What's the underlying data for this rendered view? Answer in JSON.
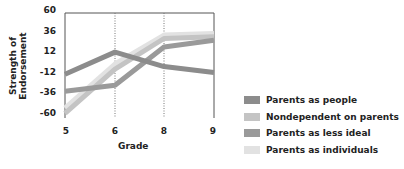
{
  "chart_data": {
    "type": "line",
    "title": "",
    "xlabel": "Grade",
    "ylabel": "Strength of Endorsement",
    "x": [
      5,
      6,
      8,
      9
    ],
    "categories": [
      "5",
      "6",
      "8",
      "9"
    ],
    "yticks": [
      60,
      36,
      12,
      -12,
      -36,
      -60
    ],
    "ylim": [
      -60,
      60
    ],
    "grid": "vertical dotted at grades 6 and 8",
    "legend_position": "right-bottom",
    "series": [
      {
        "name": "Parents as people",
        "color": "#8c8c8c",
        "values": [
          -12,
          14,
          -3,
          -10
        ]
      },
      {
        "name": "Nondependent on parents",
        "color": "#c4c4c4",
        "values": [
          -58,
          -6,
          30,
          32
        ]
      },
      {
        "name": "Parents as less ideal",
        "color": "#9a9a9a",
        "values": [
          -32,
          -25,
          20,
          28
        ]
      },
      {
        "name": "Parents as individuals",
        "color": "#e2e2e2",
        "values": [
          -52,
          0,
          34,
          36
        ]
      }
    ]
  },
  "axis": {
    "ylabel": "Strength of Endorsement",
    "xlabel": "Grade",
    "yticks": [
      "60",
      "36",
      "12",
      "-12",
      "-36",
      "-60"
    ],
    "xticks": [
      "5",
      "6",
      "8",
      "9"
    ]
  },
  "legend": [
    {
      "label": "Parents as people",
      "color": "#8c8c8c"
    },
    {
      "label": "Nondependent on parents",
      "color": "#c4c4c4"
    },
    {
      "label": "Parents as less ideal",
      "color": "#9a9a9a"
    },
    {
      "label": "Parents as individuals",
      "color": "#e2e2e2"
    }
  ]
}
